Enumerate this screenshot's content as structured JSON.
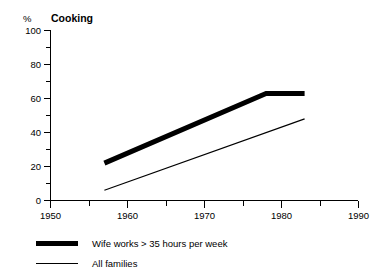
{
  "chart_data": {
    "type": "line",
    "title": "Cooking",
    "xlabel": "",
    "ylabel": "%",
    "xlim": [
      1950,
      1990
    ],
    "ylim": [
      0,
      100
    ],
    "grid": false,
    "legend_position": "below-axes-left",
    "x_ticks": [
      1950,
      1960,
      1970,
      1980,
      1990
    ],
    "x_tick_labels": [
      "1950",
      "1960",
      "1970",
      "1980",
      "1990"
    ],
    "x_minor_ticks": [
      1955,
      1965,
      1975,
      1985
    ],
    "y_ticks": [
      0,
      20,
      40,
      60,
      80,
      100
    ],
    "y_tick_labels": [
      "0",
      "20",
      "40",
      "60",
      "80",
      "100"
    ],
    "y_minor_ticks": [
      10,
      30,
      50,
      70,
      90
    ],
    "series": [
      {
        "name": "Wife works > 35 hours per week",
        "style": "thick",
        "x": [
          1957,
          1978,
          1983
        ],
        "values": [
          22,
          63,
          63
        ]
      },
      {
        "name": "All families",
        "style": "thin",
        "x": [
          1957,
          1983
        ],
        "values": [
          6,
          48
        ]
      }
    ]
  },
  "axes": {
    "y_unit_label": "%",
    "title": "Cooking"
  },
  "legend": {
    "items": [
      {
        "label": "Wife works > 35 hours per week",
        "style": "thick"
      },
      {
        "label": "All families",
        "style": "thin"
      }
    ]
  }
}
